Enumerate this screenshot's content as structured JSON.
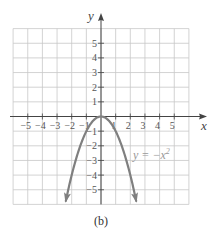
{
  "chart_data": {
    "type": "line",
    "title": "",
    "caption": "(b)",
    "xlabel": "x",
    "ylabel": "y",
    "xlim": [
      -6,
      6
    ],
    "ylim": [
      -6,
      6
    ],
    "grid": true,
    "x_ticks": [
      -5,
      -4,
      -3,
      -2,
      -1,
      1,
      2,
      3,
      4,
      5
    ],
    "x_tick_labels": [
      "−5",
      "−4",
      "−3",
      "−2",
      "−1",
      "1",
      "2",
      "3",
      "4",
      "5"
    ],
    "y_ticks": [
      5,
      4,
      3,
      2,
      1,
      -1,
      -2,
      -3,
      -4,
      -5
    ],
    "y_tick_labels": [
      "5",
      "4",
      "3",
      "2",
      "1",
      "−1",
      "−2",
      "−3",
      "−4",
      "−5"
    ],
    "series": [
      {
        "name": "y = −x²",
        "function": "-x^2",
        "x_range": [
          -2.4,
          2.4
        ],
        "arrows": "both-ends",
        "color": "#7f7f7f"
      }
    ],
    "annotation": {
      "text": "y = −x²",
      "anchor": [
        2.4,
        -2.6
      ]
    }
  },
  "colors": {
    "grid": "#c8c8c8",
    "axis": "#444444",
    "curve": "#7f7f7f"
  }
}
